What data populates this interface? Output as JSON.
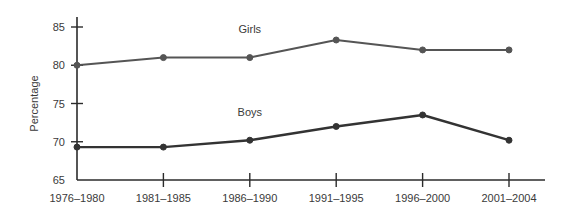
{
  "chart_data": {
    "type": "line",
    "title": "",
    "xlabel": "",
    "ylabel": "Percentage",
    "ylim": [
      65,
      85
    ],
    "yticks": [
      65,
      70,
      75,
      80,
      85
    ],
    "ytick_labels": [
      "65",
      "70",
      "75",
      "80",
      "85"
    ],
    "grid": false,
    "legend": "inline-series-labels",
    "categories": [
      "1976–1980",
      "1981–1985",
      "1986–1990",
      "1991–1995",
      "1996–2000",
      "2001–2004"
    ],
    "series": [
      {
        "name": "Girls",
        "values": [
          80.0,
          81.0,
          81.0,
          83.3,
          82.0,
          82.0
        ],
        "color": "#555555",
        "label_at_category_index": 2,
        "label_value": 84.2
      },
      {
        "name": "Boys",
        "values": [
          69.3,
          69.3,
          70.2,
          72.0,
          73.5,
          70.2
        ],
        "color": "#333333",
        "label_at_category_index": 2,
        "label_value": 73.4
      }
    ],
    "marker": "circle",
    "background_color": "#ffffff",
    "axis_color": "#2b2b2b"
  }
}
